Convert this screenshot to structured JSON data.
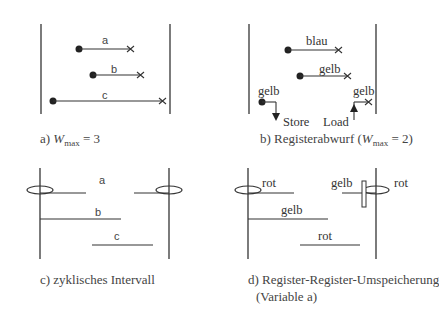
{
  "panels": {
    "a": {
      "labels": {
        "a": "a",
        "b": "b",
        "c": "c"
      },
      "caption_prefix": "a) ",
      "caption_var": "W",
      "caption_sub": "max",
      "caption_suffix": " = 3"
    },
    "b": {
      "labels": {
        "top": "blau",
        "mid": "gelb",
        "left": "gelb",
        "right": "gelb",
        "store": "Store",
        "load": "Load"
      },
      "caption_prefix": "b) Registerabwurf (",
      "caption_var": "W",
      "caption_sub": "max",
      "caption_suffix": " = 2)"
    },
    "c": {
      "labels": {
        "a": "a",
        "b": "b",
        "c": "c"
      },
      "caption": "c) zyklisches Intervall"
    },
    "d": {
      "labels": {
        "rot1": "rot",
        "gelb1": "gelb",
        "rot_right": "rot",
        "gelb2": "gelb",
        "rot2": "rot"
      },
      "caption_line1": "d) Register-Register-Umspeicherung",
      "caption_line2": "(Variable a)"
    }
  },
  "colors": {
    "line": "#333333",
    "text": "#444444"
  }
}
